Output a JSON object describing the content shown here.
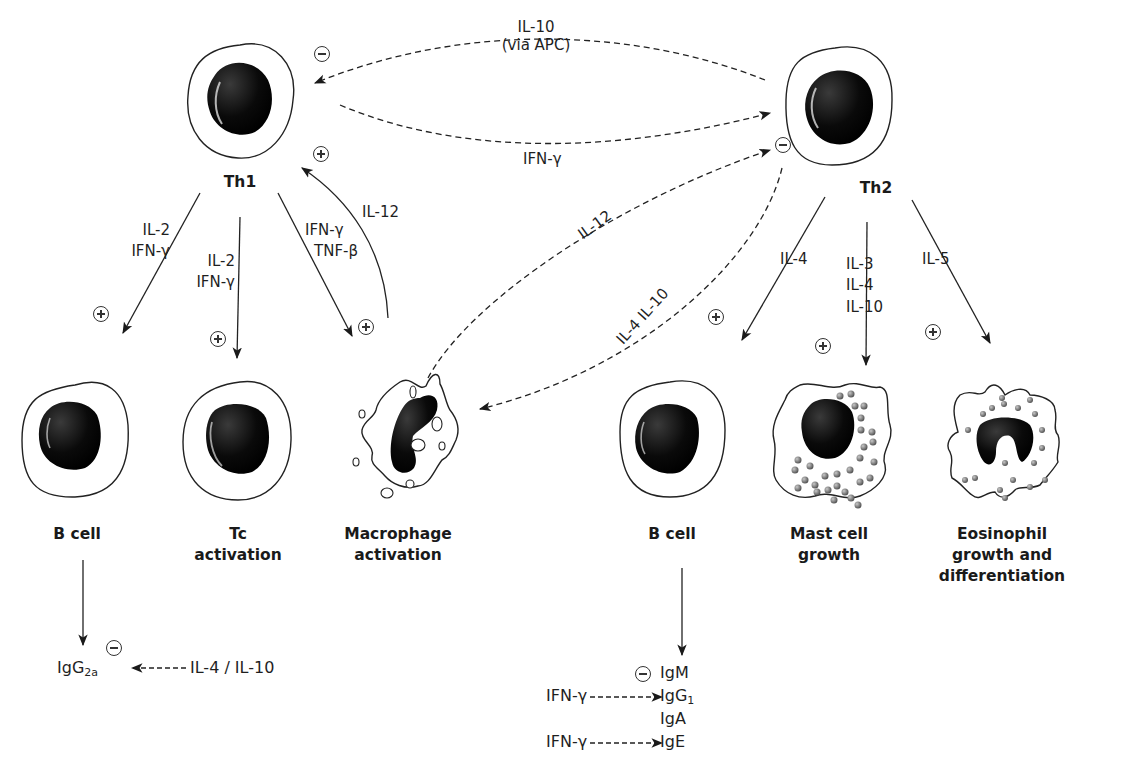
{
  "cells": {
    "th1": "Th1",
    "th2": "Th2",
    "b_cell_left": "B cell",
    "tc": [
      "Tc",
      "activation"
    ],
    "macrophage": [
      "Macrophage",
      "activation"
    ],
    "b_cell_right": "B cell",
    "mast": [
      "Mast cell",
      "growth"
    ],
    "eosinophil": [
      "Eosinophil",
      "growth and",
      "differentiation"
    ]
  },
  "cross_regulation": {
    "th2_to_th1": [
      "IL-10",
      "(via APC)"
    ],
    "th1_to_th2": "IFN-γ",
    "macrophage_to_th2": "IL-12",
    "th2_to_macrophage": "IL-4 IL-10",
    "macrophage_to_th1": "IL-12"
  },
  "th1_outputs": {
    "to_b_cell": [
      "IL-2",
      "IFN-γ"
    ],
    "to_tc": [
      "IL-2",
      "IFN-γ"
    ],
    "to_macrophage": [
      "IFN-γ",
      "TNF-β"
    ]
  },
  "th2_outputs": {
    "to_b_cell": "IL-4",
    "to_mast": [
      "IL-3",
      "IL-4",
      "IL-10"
    ],
    "to_eosinophil": "IL-5"
  },
  "antibodies": {
    "left": {
      "isotype": "IgG",
      "sub": "2a",
      "inhibitor": "IL-4 / IL-10"
    },
    "right": {
      "igm": "IgM",
      "igg1": "IgG",
      "igg1_sub": "1",
      "iga": "IgA",
      "ige": "IgE",
      "igg1_inducer": "IFN-γ",
      "ige_inducer": "IFN-γ"
    }
  },
  "signs": {
    "plus": "⊕",
    "minus": "⊖"
  }
}
